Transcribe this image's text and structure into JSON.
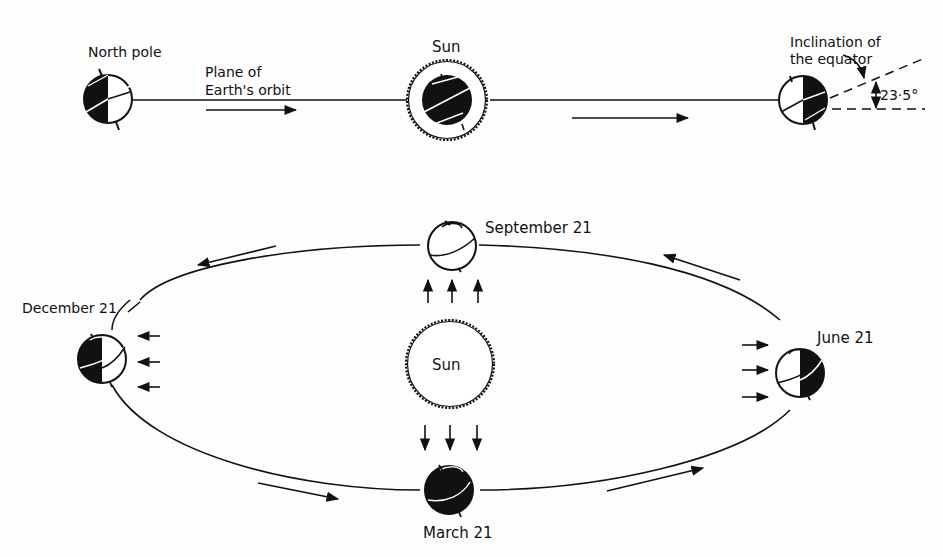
{
  "diagram": {
    "top_row": {
      "north_pole_label": "North pole",
      "orbit_plane_label_line1": "Plane of",
      "orbit_plane_label_line2": "Earth's orbit",
      "sun_label": "Sun",
      "inclination_label_line1": "Inclination of",
      "inclination_label_line2": "the equator",
      "angle_label": "23·5°"
    },
    "orbit": {
      "sun_label": "Sun",
      "positions": [
        {
          "id": "september",
          "label": "September 21"
        },
        {
          "id": "december",
          "label": "December 21"
        },
        {
          "id": "june",
          "label": "June 21"
        },
        {
          "id": "march",
          "label": "March 21"
        }
      ]
    },
    "colors": {
      "ink": "#111111",
      "background": "#fdfdfd"
    }
  }
}
